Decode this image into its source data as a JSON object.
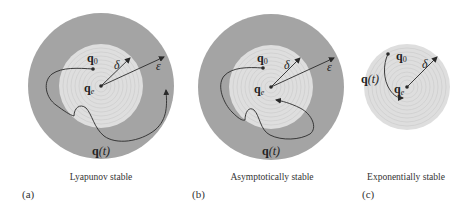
{
  "figure": {
    "colors": {
      "outer_region": "#a4a4a4",
      "inner_region": "#dedede",
      "inner_rings": "#c9c9c9",
      "line": "#2a2a2a",
      "background": "#ffffff"
    },
    "panels": [
      {
        "id": "a",
        "tag": "(a)",
        "caption": "Lyapunov stable",
        "has_epsilon_region": true,
        "labels": {
          "q0": "q",
          "q0_sub": "0",
          "qe": "q",
          "qe_sub": "e",
          "qt": "q",
          "qt_paren": "(t)",
          "delta": "δ",
          "epsilon": "ε"
        }
      },
      {
        "id": "b",
        "tag": "(b)",
        "caption": "Asymptotically stable",
        "has_epsilon_region": true,
        "labels": {
          "q0": "q",
          "q0_sub": "0",
          "qe": "q",
          "qe_sub": "e",
          "qt": "q",
          "qt_paren": "(t)",
          "delta": "δ",
          "epsilon": "ε"
        }
      },
      {
        "id": "c",
        "tag": "(c)",
        "caption": "Exponentially stable",
        "has_epsilon_region": false,
        "labels": {
          "q0": "q",
          "q0_sub": "0",
          "qe": "q",
          "qe_sub": "e",
          "qt": "q",
          "qt_paren": "(t)",
          "delta": "δ"
        }
      }
    ]
  }
}
